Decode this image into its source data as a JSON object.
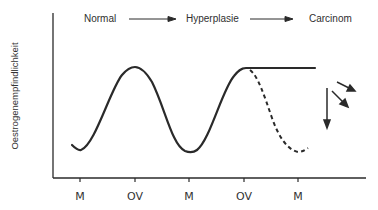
{
  "diagram": {
    "stages": [
      {
        "label": "Normal"
      },
      {
        "label": "Hyperplasie"
      },
      {
        "label": "Carcinom"
      }
    ],
    "y_axis_label": "Oestrogenempfindlichkeit",
    "x_ticks": [
      {
        "label": "M"
      },
      {
        "label": "OV"
      },
      {
        "label": "M"
      },
      {
        "label": "OV"
      },
      {
        "label": "M"
      }
    ],
    "curves": {
      "cyclic": "solid sinusoid: troughs at M, peaks at OV",
      "plateau": "solid horizontal line continuing from second OV peak (persistent high sensitivity)",
      "normal_decline": "dashed curve falling to trough at third M"
    },
    "arrows": [
      "down",
      "down-right",
      "right-down"
    ],
    "colors": {
      "ink": "#2a2a2a",
      "background": "#ffffff"
    }
  }
}
